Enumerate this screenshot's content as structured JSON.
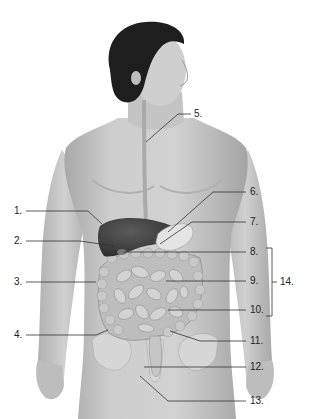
{
  "diagram": {
    "type": "anatomical-figure",
    "colors": {
      "background": "#ffffff",
      "skin": "#c9c9c9",
      "skin_shadow": "#a9a9a9",
      "hair": "#1e1e1e",
      "liver": "#4a4a4a",
      "stomach": "#e2e2e2",
      "intestine": "#b5b5b5",
      "leader_line": "#333333",
      "label_text": "#222222"
    },
    "labels": [
      {
        "id": "1",
        "text": "1.",
        "side": "left"
      },
      {
        "id": "2",
        "text": "2.",
        "side": "left"
      },
      {
        "id": "3",
        "text": "3.",
        "side": "left"
      },
      {
        "id": "4",
        "text": "4.",
        "side": "left"
      },
      {
        "id": "5",
        "text": "5.",
        "side": "right"
      },
      {
        "id": "6",
        "text": "6.",
        "side": "right"
      },
      {
        "id": "7",
        "text": "7.",
        "side": "right"
      },
      {
        "id": "8",
        "text": "8.",
        "side": "right"
      },
      {
        "id": "9",
        "text": "9.",
        "side": "right"
      },
      {
        "id": "10",
        "text": "10.",
        "side": "right"
      },
      {
        "id": "11",
        "text": "11.",
        "side": "right"
      },
      {
        "id": "12",
        "text": "12.",
        "side": "right"
      },
      {
        "id": "13",
        "text": "13.",
        "side": "right"
      }
    ],
    "bracket": {
      "text": "14.",
      "groups": [
        "8.",
        "9.",
        "10."
      ]
    }
  }
}
